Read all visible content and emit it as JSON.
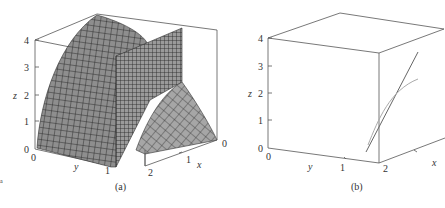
{
  "figure": {
    "panels": [
      {
        "caption": "(a)",
        "z_axis": {
          "label": "z",
          "ticks": [
            "0",
            "1",
            "2",
            "3",
            "4"
          ]
        },
        "y_axis": {
          "label": "y",
          "ticks": [
            "0",
            "1"
          ]
        },
        "x_axis": {
          "label": "x",
          "ticks": [
            "0",
            "1",
            "2"
          ]
        },
        "content": "paraboloid-like surface z = 4 - x^2 intersected by a vertical plane, shaded gray mesh"
      },
      {
        "caption": "(b)",
        "z_axis": {
          "label": "z",
          "ticks": [
            "0",
            "1",
            "2",
            "3",
            "4"
          ]
        },
        "y_axis": {
          "label": "y",
          "ticks": [
            "0",
            "1",
            "2"
          ]
        },
        "x_axis": {
          "label": "x",
          "ticks": [
            "1"
          ]
        },
        "content": "two curves: a straight line and a curved line tangent near z=1"
      }
    ],
    "stray_mark": "a"
  },
  "colors": {
    "surface": "#8a8a8a",
    "mesh": "#222222",
    "box": "#555555",
    "line_dark": "#666666",
    "line_light": "#aaaaaa"
  }
}
